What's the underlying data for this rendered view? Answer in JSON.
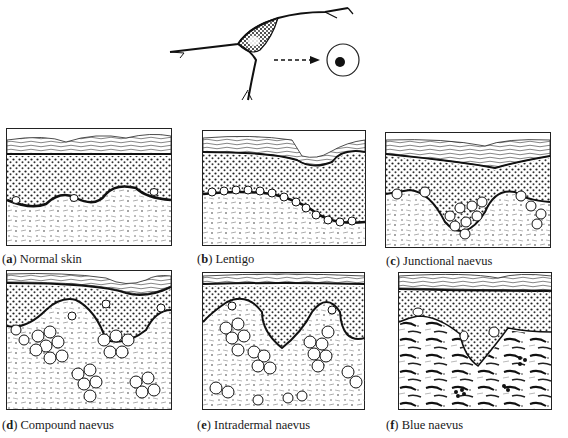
{
  "figure": {
    "top_illustration": {
      "label": "melanocyte-to-naevus-cell transformation",
      "elements": [
        "dendritic-melanocyte",
        "dashed-arrow",
        "naevus-cell"
      ]
    },
    "panels": [
      {
        "letter": "a",
        "open": "(",
        "close": ")",
        "title": " Normal skin"
      },
      {
        "letter": "b",
        "open": "(",
        "close": ")",
        "title": " Lentigo"
      },
      {
        "letter": "c",
        "open": "(",
        "close": ")",
        "title": " Junctional naevus"
      },
      {
        "letter": "d",
        "open": "(",
        "close": ")",
        "title": " Compound naevus"
      },
      {
        "letter": "e",
        "open": "(",
        "close": ")",
        "title": " Intradermal naevus"
      },
      {
        "letter": "f",
        "open": "(",
        "close": ")",
        "title": " Blue naevus"
      }
    ],
    "colors": {
      "ink": "#1a1a1a",
      "paper": "#ffffff"
    }
  }
}
